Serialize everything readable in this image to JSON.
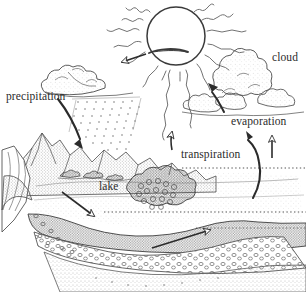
{
  "diagram": {
    "style": "pen-and-ink stipple line drawing",
    "background_color": "#ffffff",
    "ink_color": "#2b2b2b",
    "labels": [
      {
        "id": "precipitation",
        "text": "precipitation",
        "x": 6,
        "y": 91
      },
      {
        "id": "cloud",
        "text": "cloud",
        "x": 272,
        "y": 52
      },
      {
        "id": "evaporation",
        "text": "evaporation",
        "x": 231,
        "y": 116
      },
      {
        "id": "transpiration",
        "text": "transpiration",
        "x": 181,
        "y": 149
      },
      {
        "id": "lake",
        "text": "lake",
        "x": 99,
        "y": 181
      }
    ],
    "elements": {
      "sun": "circle with wavy radiating rays",
      "rain_cloud": "stippled cumulus cloud at left with falling rain dots",
      "cumulus_cloud": "stippled cumulus cloud cluster at right",
      "mountains": "stippled mountain range",
      "lake_surface": "stippled water body",
      "trees": "cluster of small trees along shoreline",
      "ground_surface": "dotted horizontal water-table line",
      "aquifer": "cross-section of soil, gravel and bedrock layers"
    },
    "arrows": [
      {
        "id": "solar-to-cloud",
        "kind": "open",
        "direction": "down-left"
      },
      {
        "id": "evaporation-up",
        "kind": "open",
        "direction": "up"
      },
      {
        "id": "evaporation-right-up",
        "kind": "open",
        "direction": "up"
      },
      {
        "id": "transpiration-curve",
        "kind": "solid",
        "direction": "up"
      },
      {
        "id": "condensation-to-cloud",
        "kind": "solid",
        "direction": "up-left"
      },
      {
        "id": "precipitation-pointer",
        "kind": "solid",
        "direction": "down-right"
      },
      {
        "id": "infiltration",
        "kind": "open",
        "direction": "down-right"
      },
      {
        "id": "groundwater-flow",
        "kind": "open",
        "direction": "up-right"
      }
    ]
  }
}
